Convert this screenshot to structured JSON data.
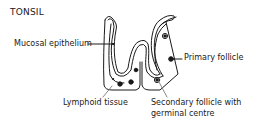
{
  "title": "TONSIL",
  "labels": {
    "mucosal_epithelium": "Mucosal epithelium",
    "primary_follicle": "Primary follicle",
    "lymphoid_tissue": "Lymphoid tissue",
    "secondary_follicle_line1": "Secondary follicle with",
    "secondary_follicle_line2": "germinal centre"
  },
  "colors": {
    "ink": "#1a1a1a",
    "background": "#ffffff"
  }
}
